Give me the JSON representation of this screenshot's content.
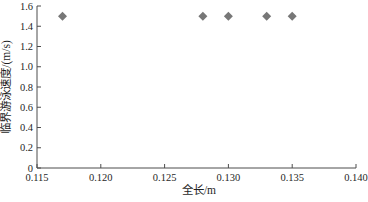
{
  "figure": {
    "background": "#ffffff",
    "width_px": 368,
    "height_px": 202
  },
  "style": {
    "axis_color": "#4d4d4d",
    "text_color": "#1f1f1f",
    "marker_color": "#777777",
    "tick_direction": "in",
    "tick_length_px": 4
  },
  "chart_data": {
    "type": "scatter",
    "title": "",
    "xlabel": "全长/m",
    "ylabel": "临界游泳速度/(m/s)",
    "xlim": [
      0.115,
      0.14
    ],
    "ylim": [
      0,
      1.6
    ],
    "grid": false,
    "legend": null,
    "spines": [
      "left",
      "bottom"
    ],
    "xticks": {
      "values": [
        0.115,
        0.12,
        0.125,
        0.13,
        0.135,
        0.14
      ],
      "labels": [
        "0.115",
        "0.120",
        "0.125",
        "0.130",
        "0.135",
        "0.140"
      ]
    },
    "yticks": {
      "values": [
        0,
        0.2,
        0.4,
        0.6,
        0.8,
        1.0,
        1.2,
        1.4,
        1.6
      ],
      "labels": [
        "0",
        "0.2",
        "0.4",
        "0.6",
        "0.8",
        "1.0",
        "1.2",
        "1.4",
        "1.6"
      ]
    },
    "series": [
      {
        "name": "critical-swimming-speed-points",
        "marker": "diamond",
        "marker_size_px": 9,
        "color": "#777777",
        "points": [
          {
            "x": 0.117,
            "y": 1.5
          },
          {
            "x": 0.128,
            "y": 1.5
          },
          {
            "x": 0.13,
            "y": 1.5
          },
          {
            "x": 0.133,
            "y": 1.5
          },
          {
            "x": 0.135,
            "y": 1.5
          }
        ]
      }
    ]
  }
}
